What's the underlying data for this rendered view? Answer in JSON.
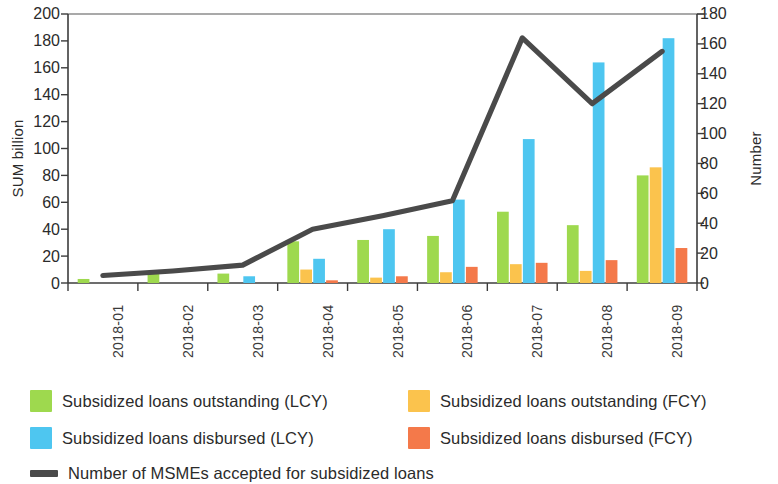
{
  "chart_data": {
    "type": "bar",
    "title": "",
    "subtitle": "",
    "xlabel": "",
    "ylabel": "SUM billion",
    "y2label": "Number",
    "ylim": [
      0,
      200
    ],
    "y2lim": [
      0,
      180
    ],
    "yticks": [
      0,
      20,
      40,
      60,
      80,
      100,
      120,
      140,
      160,
      180,
      200
    ],
    "y2ticks": [
      0,
      20,
      40,
      60,
      80,
      100,
      120,
      140,
      160,
      180
    ],
    "grid": false,
    "legend_position": "bottom",
    "categories": [
      "2018-01",
      "2018-02",
      "2018-03",
      "2018-04",
      "2018-05",
      "2018-06",
      "2018-07",
      "2018-08",
      "2018-09"
    ],
    "series": [
      {
        "name": "Subsidized loans outstanding (LCY)",
        "type": "bar",
        "axis": "left",
        "color": "#9ed94e",
        "values": [
          3,
          7,
          7,
          31,
          32,
          35,
          53,
          43,
          80
        ]
      },
      {
        "name": "Subsidized loans outstanding (FCY)",
        "type": "bar",
        "axis": "left",
        "color": "#fbc34d",
        "values": [
          0,
          0,
          0,
          10,
          4,
          8,
          14,
          9,
          86
        ]
      },
      {
        "name": "Subsidized loans disbursed (LCY)",
        "type": "bar",
        "axis": "left",
        "color": "#4ec6f0",
        "values": [
          0,
          0,
          5,
          18,
          40,
          62,
          107,
          164,
          182
        ]
      },
      {
        "name": "Subsidized loans disbursed (FCY)",
        "type": "bar",
        "axis": "left",
        "color": "#f4794a",
        "values": [
          0,
          0,
          0,
          2,
          5,
          12,
          15,
          17,
          26
        ]
      },
      {
        "name": "Number of MSMEs accepted for subsidized loans",
        "type": "line",
        "axis": "right",
        "color": "#4a4a4a",
        "values": [
          5,
          8,
          12,
          36,
          45,
          55,
          164,
          120,
          155
        ]
      }
    ]
  },
  "axes": {
    "left_title": "SUM billion",
    "right_title": "Number",
    "left_ticks": [
      "200",
      "180",
      "160",
      "140",
      "120",
      "100",
      "80",
      "60",
      "40",
      "20",
      "0"
    ],
    "right_ticks": [
      "180",
      "160",
      "140",
      "120",
      "100",
      "80",
      "60",
      "40",
      "20",
      "0"
    ],
    "x_ticks": [
      "2018-01",
      "2018-02",
      "2018-03",
      "2018-04",
      "2018-05",
      "2018-06",
      "2018-07",
      "2018-08",
      "2018-09"
    ]
  },
  "legend": {
    "items": [
      {
        "label": "Subsidized loans outstanding (LCY)",
        "color": "#9ed94e",
        "marker": "square"
      },
      {
        "label": "Subsidized loans outstanding (FCY)",
        "color": "#fbc34d",
        "marker": "square"
      },
      {
        "label": "Subsidized loans disbursed (LCY)",
        "color": "#4ec6f0",
        "marker": "square"
      },
      {
        "label": "Subsidized loans disbursed (FCY)",
        "color": "#f4794a",
        "marker": "square"
      },
      {
        "label": "Number of MSMEs accepted for subsidized loans",
        "color": "#4a4a4a",
        "marker": "line"
      }
    ]
  }
}
